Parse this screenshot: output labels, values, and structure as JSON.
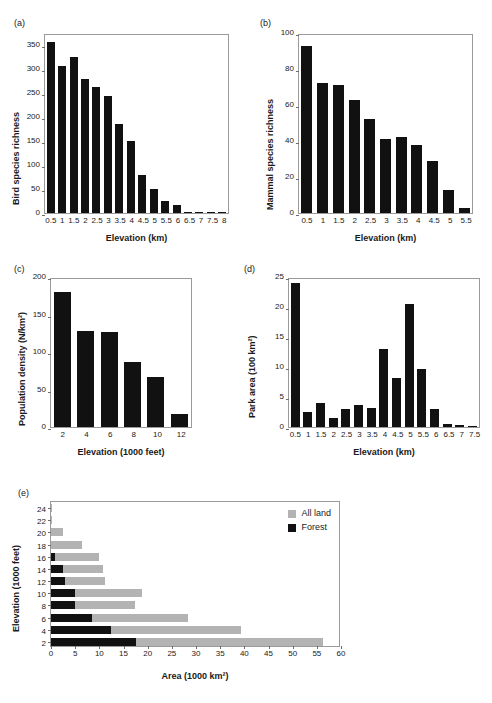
{
  "figure": {
    "panels": [
      "(a)",
      "(b)",
      "(c)",
      "(d)",
      "(e)"
    ]
  },
  "legend": {
    "all_land_label": "All land",
    "forest_label": "Forest",
    "all_land_color": "#b3b3b3",
    "forest_color": "#111111"
  },
  "chart_data": [
    {
      "id": "a",
      "panel": "(a)",
      "type": "bar",
      "title": "",
      "xlabel": "Elevation (km)",
      "ylabel": "Bird species richness",
      "categories": [
        "0.5",
        "1",
        "1.5",
        "2",
        "2.5",
        "3",
        "3.5",
        "4",
        "4.5",
        "5",
        "5.5",
        "6",
        "6.5",
        "7",
        "7.5",
        "8"
      ],
      "values": [
        357,
        306,
        325,
        279,
        262,
        243,
        185,
        149,
        80,
        51,
        25,
        16,
        3,
        3,
        1,
        1
      ],
      "ylim": [
        0,
        375
      ],
      "yticks": [
        0,
        50,
        100,
        150,
        200,
        250,
        300,
        350
      ],
      "grid": false,
      "bar_color": "#111111"
    },
    {
      "id": "b",
      "panel": "(b)",
      "type": "bar",
      "title": "",
      "xlabel": "Elevation (km)",
      "ylabel": "Mammal species richness",
      "categories": [
        "0.5",
        "1",
        "1.5",
        "2",
        "2.5",
        "3",
        "3.5",
        "4",
        "4.5",
        "5",
        "5.5"
      ],
      "values": [
        93,
        72,
        71,
        63,
        52,
        41,
        42,
        38,
        29,
        13,
        3
      ],
      "ylim": [
        0,
        100
      ],
      "yticks": [
        0,
        20,
        40,
        60,
        80,
        100
      ],
      "grid": false,
      "bar_color": "#111111"
    },
    {
      "id": "c",
      "panel": "(c)",
      "type": "bar",
      "title": "",
      "xlabel": "Elevation (1000 feet)",
      "ylabel": "Population density (N/km²)",
      "categories": [
        "2",
        "4",
        "6",
        "8",
        "10",
        "12"
      ],
      "values": [
        180,
        128,
        127,
        87,
        67,
        18
      ],
      "ylim": [
        0,
        200
      ],
      "yticks": [
        0,
        50,
        100,
        150,
        200
      ],
      "grid": false,
      "bar_color": "#111111"
    },
    {
      "id": "d",
      "panel": "(d)",
      "type": "bar",
      "title": "",
      "xlabel": "Elevation (km)",
      "ylabel": "Park area (100 km²)",
      "categories": [
        "0.5",
        "1",
        "1.5",
        "2",
        "2.5",
        "3",
        "3.5",
        "4",
        "4.5",
        "5",
        "5.5",
        "6",
        "6.5",
        "7",
        "7.5"
      ],
      "values": [
        24.0,
        2.5,
        4.0,
        1.5,
        3.0,
        3.6,
        3.2,
        13.0,
        8.2,
        20.5,
        9.7,
        3.0,
        0.5,
        0.3,
        0.15
      ],
      "ylim": [
        0,
        25
      ],
      "yticks": [
        0,
        5,
        10,
        15,
        20,
        25
      ],
      "grid": false,
      "bar_color": "#111111"
    },
    {
      "id": "e",
      "panel": "(e)",
      "type": "bar",
      "orientation": "horizontal",
      "title": "",
      "xlabel": "Area (1000 km²)",
      "ylabel": "Elevation (1000 feet)",
      "categories": [
        "24",
        "22",
        "20",
        "18",
        "16",
        "14",
        "12",
        "10",
        "8",
        "6",
        "4",
        "2"
      ],
      "series": [
        {
          "name": "All land",
          "values": [
            0.2,
            0.3,
            2.4,
            6.5,
            10.0,
            10.8,
            11.1,
            18.8,
            17.3,
            28.4,
            39.3,
            56.2
          ]
        },
        {
          "name": "Forest",
          "values": [
            0.0,
            0.0,
            0.0,
            0.0,
            0.8,
            2.5,
            2.9,
            4.9,
            4.9,
            8.4,
            12.4,
            17.5
          ]
        }
      ],
      "xlim": [
        0,
        60
      ],
      "xticks": [
        0,
        5,
        10,
        15,
        20,
        25,
        30,
        35,
        40,
        45,
        50,
        55,
        60
      ],
      "grid": false,
      "legend_position": "top-right"
    }
  ]
}
